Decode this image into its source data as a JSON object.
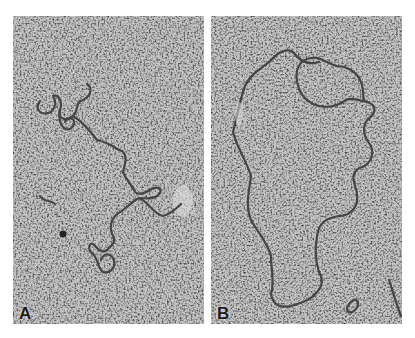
{
  "figure": {
    "panels": [
      {
        "label": "A",
        "content": "supercoiled (twisted, compact) DNA molecule"
      },
      {
        "label": "B",
        "content": "relaxed open circular DNA molecule"
      }
    ]
  },
  "colors": {
    "background": "#ffffff",
    "grain_light": "#cfcfcf",
    "grain_dark": "#3a3a3a",
    "strand": "#4a4a4a"
  }
}
